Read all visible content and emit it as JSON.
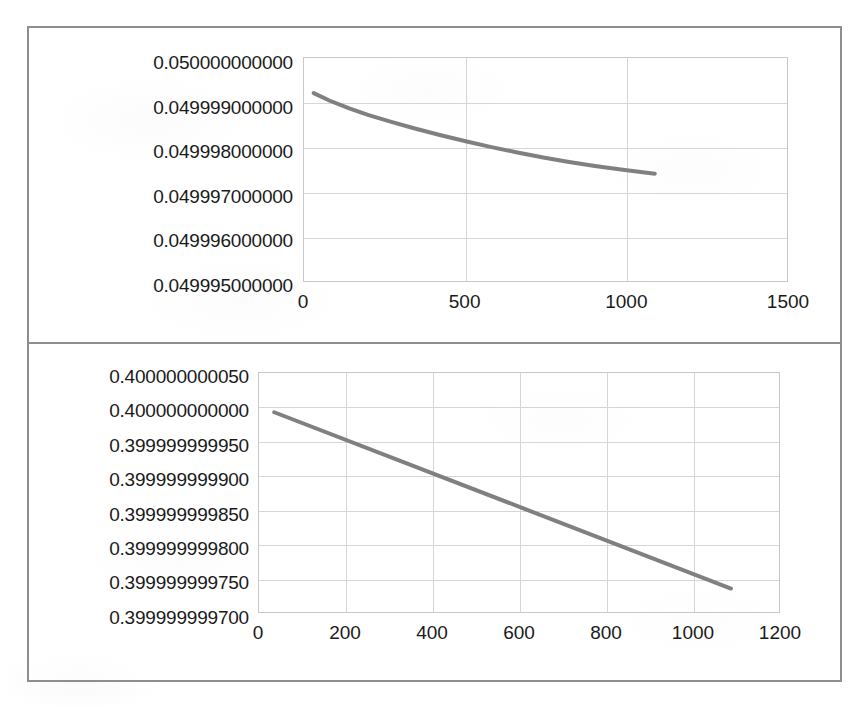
{
  "page": {
    "background_color": "#ffffff",
    "frame_color": "#8d8d92",
    "series_color": "#808080",
    "gridline_color": "#d6d6da",
    "plot_border_color": "#c8c8cc"
  },
  "chart_data": [
    {
      "id": "top",
      "type": "line",
      "title": "",
      "xlabel": "",
      "ylabel": "",
      "grid": true,
      "legend": "none",
      "xlim": [
        0,
        1500
      ],
      "ylim": [
        0.049995,
        0.05
      ],
      "xticks": [
        0,
        500,
        1000,
        1500
      ],
      "xtick_labels": [
        "0",
        "500",
        "1000",
        "1500"
      ],
      "yticks": [
        0.05,
        0.049999,
        0.049998,
        0.049997,
        0.049996,
        0.049995
      ],
      "ytick_labels": [
        "0.050000000000",
        "0.049999000000",
        "0.049998000000",
        "0.049997000000",
        "0.049996000000",
        "0.049995000000"
      ],
      "series": [
        {
          "name": "series-1",
          "color": "#808080",
          "x": [
            30,
            80,
            140,
            200,
            270,
            340,
            420,
            500,
            580,
            660,
            740,
            820,
            900,
            980,
            1060,
            1085
          ],
          "y": [
            0.04999922,
            0.04999905,
            0.04999888,
            0.04999873,
            0.04999858,
            0.04999844,
            0.04999829,
            0.04999815,
            0.04999802,
            0.0499979,
            0.04999779,
            0.04999769,
            0.0499976,
            0.04999752,
            0.04999745,
            0.04999743
          ]
        }
      ]
    },
    {
      "id": "bottom",
      "type": "line",
      "title": "",
      "xlabel": "",
      "ylabel": "",
      "grid": true,
      "legend": "none",
      "xlim": [
        0,
        1200
      ],
      "ylim": [
        0.3999999997,
        0.40000000005
      ],
      "xticks": [
        0,
        200,
        400,
        600,
        800,
        1000,
        1200
      ],
      "xtick_labels": [
        "0",
        "200",
        "400",
        "600",
        "800",
        "1000",
        "1200"
      ],
      "yticks": [
        0.40000000005,
        0.4,
        0.39999999995,
        0.3999999999,
        0.39999999985,
        0.3999999998,
        0.39999999975,
        0.3999999997
      ],
      "ytick_labels": [
        "0.400000000050",
        "0.400000000000",
        "0.399999999950",
        "0.399999999900",
        "0.399999999850",
        "0.399999999800",
        "0.399999999750",
        "0.399999999700"
      ],
      "series": [
        {
          "name": "series-1",
          "color": "#808080",
          "x": [
            35,
            1085
          ],
          "y": [
            0.399999999993,
            0.399999999737
          ]
        }
      ]
    }
  ]
}
